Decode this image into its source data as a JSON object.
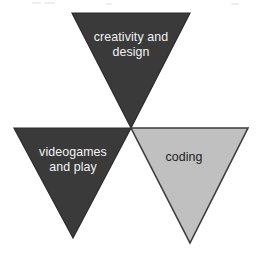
{
  "diagram": {
    "type": "three-inverted-triangles",
    "background_color": "#ffffff",
    "nodes": [
      {
        "id": "creativity",
        "label": "creativity and\ndesign",
        "fill_color": "#3a3a3a",
        "stroke_color": "#2a2a2a",
        "text_color": "#f2f2f2",
        "position": "top",
        "points": "72,13 190,13 131,128"
      },
      {
        "id": "videogames",
        "label": "videogames\nand play",
        "fill_color": "#3a3a3a",
        "stroke_color": "#2a2a2a",
        "text_color": "#f2f2f2",
        "position": "bottom-left",
        "points": "14,128 131,128 73,238"
      },
      {
        "id": "coding",
        "label": "coding",
        "fill_color": "#c0c0c0",
        "stroke_color": "#3d3d3d",
        "text_color": "#1d1d1d",
        "position": "bottom-right",
        "points": "131,128 248,128 190,243"
      }
    ],
    "artifacts": [
      {
        "left": 32,
        "top": 2,
        "width": 9
      },
      {
        "left": 44,
        "top": 2,
        "width": 11
      },
      {
        "left": 106,
        "top": 3,
        "width": 6
      },
      {
        "left": 231,
        "top": 3,
        "width": 8
      }
    ]
  }
}
